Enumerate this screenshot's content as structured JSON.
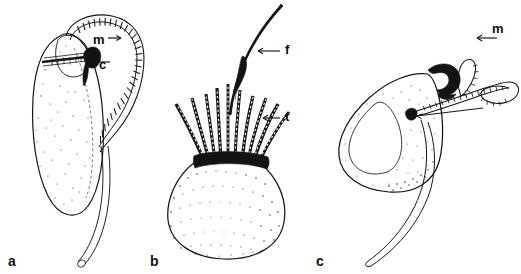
{
  "figure": {
    "type": "scientific-line-drawing",
    "background_color": "#ffffff",
    "ink_color": "#151515",
    "width": 521,
    "height": 274,
    "panel_count": 3
  },
  "panels": [
    {
      "letter": "a",
      "description": "Ovoid stippled cell body with an anterior hooked peristomial lobe bearing a row of membranelles, a dark cytostome/cilium bundle, and a long tapering stalk ending in an open tube.",
      "callouts": [
        {
          "key": "m",
          "label": "m",
          "meaning": "membranelles",
          "arrow": "right"
        },
        {
          "key": "c",
          "label": "c",
          "meaning": "cytostome",
          "arrow": "left"
        }
      ]
    },
    {
      "letter": "b",
      "description": "Rounded, densely stippled body crowned by a fan of speckled tentacles and one long dark flagellum curving up and to the right.",
      "callouts": [
        {
          "key": "f",
          "label": "f",
          "meaning": "flagellum",
          "arrow": "left"
        },
        {
          "key": "t",
          "label": "t",
          "meaning": "tentacles",
          "arrow": "left"
        }
      ]
    },
    {
      "letter": "c",
      "description": "Teardrop stippled body tilted left with a dark hooked apical structure and a long everted fringed ribbon looping to the right, plus a forked trailing stalk.",
      "callouts": [
        {
          "key": "m",
          "label": "m",
          "meaning": "membranelle ribbon",
          "arrow": "left"
        }
      ]
    }
  ],
  "labels": {
    "panel_a_letter": "a",
    "panel_b_letter": "b",
    "panel_c_letter": "c",
    "a_m": "m",
    "a_c": "c",
    "b_f": "f",
    "b_t": "t",
    "c_m": "m"
  }
}
